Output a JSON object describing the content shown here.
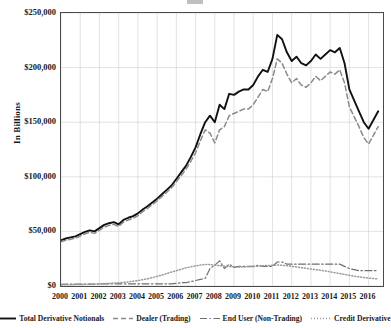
{
  "axis": {
    "y_title": "In Billions",
    "y_ticks": [
      "$250,000",
      "$200,000",
      "$150,000",
      "$100,000",
      "$50,000",
      "$0"
    ],
    "y_values": [
      250000,
      200000,
      150000,
      100000,
      50000,
      0
    ],
    "x_ticks": [
      "2000",
      "2001",
      "2002",
      "2003",
      "2004",
      "2005",
      "2006",
      "2007",
      "2008",
      "2009",
      "2010",
      "2011",
      "2012",
      "2013",
      "2014",
      "2015",
      "2016"
    ]
  },
  "legend": {
    "items": [
      {
        "label": "Total Derivative Notionals",
        "style": "solid",
        "color": "#111111"
      },
      {
        "label": "Dealer (Trading)",
        "style": "dashed",
        "color": "#8a8a8a"
      },
      {
        "label": "End User (Non-Trading)",
        "style": "dashdot",
        "color": "#6f6f6f"
      },
      {
        "label": "Credit Derivative",
        "style": "dotted",
        "color": "#9a9a9a"
      }
    ]
  },
  "chart_data": {
    "type": "line",
    "title": "",
    "xlabel": "",
    "ylabel": "In Billions",
    "xlim": [
      2000,
      2016.75
    ],
    "ylim": [
      0,
      250000
    ],
    "grid": true,
    "legend_position": "bottom",
    "x": [
      2000,
      2000.25,
      2000.5,
      2000.75,
      2001,
      2001.25,
      2001.5,
      2001.75,
      2002,
      2002.25,
      2002.5,
      2002.75,
      2003,
      2003.25,
      2003.5,
      2003.75,
      2004,
      2004.25,
      2004.5,
      2004.75,
      2005,
      2005.25,
      2005.5,
      2005.75,
      2006,
      2006.25,
      2006.5,
      2006.75,
      2007,
      2007.25,
      2007.5,
      2007.75,
      2008,
      2008.25,
      2008.5,
      2008.75,
      2009,
      2009.25,
      2009.5,
      2009.75,
      2010,
      2010.25,
      2010.5,
      2010.75,
      2011,
      2011.25,
      2011.5,
      2011.75,
      2012,
      2012.25,
      2012.5,
      2012.75,
      2013,
      2013.25,
      2013.5,
      2013.75,
      2014,
      2014.25,
      2014.5,
      2014.75,
      2015,
      2015.25,
      2015.5,
      2015.75,
      2016,
      2016.25,
      2016.5
    ],
    "series": [
      {
        "name": "Total Derivative Notionals",
        "style": "solid",
        "color": "#111111",
        "values": [
          42000,
          43500,
          44500,
          45500,
          47500,
          49500,
          51000,
          50000,
          53000,
          56000,
          57500,
          58500,
          56500,
          60500,
          62500,
          64000,
          66500,
          70000,
          73000,
          76500,
          80000,
          84000,
          88000,
          92000,
          98000,
          104000,
          110000,
          118000,
          127000,
          139000,
          150000,
          156000,
          150000,
          166000,
          162000,
          176000,
          175000,
          178000,
          180000,
          180000,
          184000,
          192000,
          198000,
          196000,
          208000,
          230000,
          226000,
          214000,
          206000,
          210000,
          204000,
          202000,
          206000,
          212000,
          208000,
          212000,
          216000,
          214000,
          218000,
          204000,
          180000,
          170000,
          160000,
          150000,
          144000,
          152000,
          160000
        ]
      },
      {
        "name": "Dealer (Trading)",
        "style": "dashed",
        "color": "#8a8a8a",
        "values": [
          40500,
          41800,
          42800,
          43800,
          45800,
          47800,
          49200,
          48200,
          51200,
          54000,
          55500,
          56500,
          54500,
          58500,
          60500,
          62000,
          64500,
          68000,
          71000,
          74500,
          78000,
          82000,
          86000,
          90000,
          95500,
          101000,
          107000,
          114000,
          122000,
          133000,
          143000,
          140000,
          131000,
          143000,
          146000,
          156000,
          158000,
          160000,
          162000,
          162000,
          166000,
          173000,
          180000,
          178000,
          190000,
          208000,
          204000,
          194000,
          186000,
          190000,
          184000,
          182000,
          186000,
          192000,
          188000,
          192000,
          196000,
          194000,
          198000,
          186000,
          164000,
          155000,
          146000,
          136000,
          130000,
          138000,
          146000
        ]
      },
      {
        "name": "End User (Non-Trading)",
        "style": "dashdot",
        "color": "#6f6f6f",
        "values": [
          1500,
          1700,
          1700,
          1700,
          1700,
          1700,
          1800,
          1800,
          1800,
          2000,
          2000,
          2000,
          2000,
          2000,
          2000,
          2000,
          2000,
          2000,
          2000,
          2000,
          2000,
          2000,
          2000,
          2000,
          2500,
          3000,
          3000,
          4000,
          5000,
          6000,
          7000,
          16000,
          19000,
          23000,
          16000,
          20000,
          17000,
          18000,
          18000,
          18000,
          18000,
          19000,
          18000,
          18000,
          18000,
          22000,
          22000,
          20000,
          20000,
          20000,
          20000,
          20000,
          20000,
          20000,
          20000,
          20000,
          20000,
          20000,
          20000,
          18000,
          16000,
          15000,
          14000,
          14000,
          14000,
          14000,
          14000
        ]
      },
      {
        "name": "Credit Derivative",
        "style": "dotted",
        "color": "#9a9a9a",
        "values": [
          1000,
          1100,
          1200,
          1300,
          1400,
          1500,
          1600,
          1800,
          2000,
          2200,
          2400,
          2700,
          3000,
          3400,
          3800,
          4300,
          5000,
          5800,
          6600,
          7600,
          8800,
          10000,
          11400,
          12800,
          14000,
          15400,
          16600,
          17600,
          18400,
          19200,
          19800,
          19600,
          19000,
          18600,
          18200,
          17800,
          17600,
          17400,
          17400,
          17600,
          17800,
          18200,
          18600,
          18800,
          19000,
          19200,
          19000,
          18600,
          18000,
          17400,
          16800,
          16200,
          15600,
          15000,
          14400,
          13800,
          13000,
          12200,
          11400,
          10600,
          9800,
          9000,
          8400,
          7800,
          7200,
          6800,
          6400
        ]
      }
    ]
  }
}
